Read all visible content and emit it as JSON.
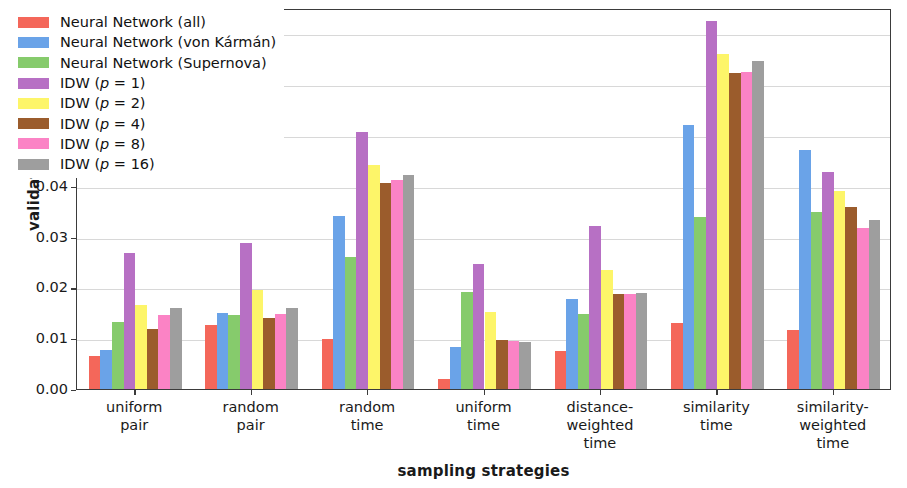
{
  "chart_data": {
    "type": "bar",
    "title": "",
    "xlabel": "sampling strategies",
    "ylabel": "validation cost",
    "ylim": [
      0.0,
      0.075
    ],
    "yticks": [
      "0.00",
      "0.01",
      "0.02",
      "0.03",
      "0.04",
      "0.05",
      "0.06",
      "0.07"
    ],
    "ytick_values": [
      0.0,
      0.01,
      0.02,
      0.03,
      0.04,
      0.05,
      0.06,
      0.07
    ],
    "grid": true,
    "legend_position": "upper left",
    "categories": [
      "uniform\npair",
      "random\npair",
      "random\ntime",
      "uniform\ntime",
      "distance-\nweighted\ntime",
      "similarity\ntime",
      "similarity-\nweighted\ntime"
    ],
    "category_lines": [
      [
        "uniform",
        "pair"
      ],
      [
        "random",
        "pair"
      ],
      [
        "random",
        "time"
      ],
      [
        "uniform",
        "time"
      ],
      [
        "distance-",
        "weighted",
        "time"
      ],
      [
        "similarity",
        "time"
      ],
      [
        "similarity-",
        "weighted",
        "time"
      ]
    ],
    "series": [
      {
        "name": "Neural Network (all)",
        "color": "#f4675a",
        "values": [
          0.0065,
          0.0126,
          0.0098,
          0.002,
          0.0074,
          0.0129,
          0.0117
        ]
      },
      {
        "name": "Neural Network (von Kármán)",
        "color": "#6aa3e8",
        "values": [
          0.0076,
          0.0149,
          0.034,
          0.0082,
          0.0177,
          0.052,
          0.0471
        ]
      },
      {
        "name": "Neural Network (Supernova)",
        "color": "#86cb6c",
        "values": [
          0.0131,
          0.0146,
          0.026,
          0.0191,
          0.0148,
          0.0338,
          0.0348
        ]
      },
      {
        "name": "IDW (p = 1)",
        "color": "#b770c4",
        "values": [
          0.0267,
          0.0287,
          0.0506,
          0.0246,
          0.032,
          0.0724,
          0.0428
        ]
      },
      {
        "name": "IDW (p = 2)",
        "color": "#fdf569",
        "values": [
          0.0166,
          0.0194,
          0.0441,
          0.0152,
          0.0234,
          0.0659,
          0.0389
        ]
      },
      {
        "name": "IDW (p = 4)",
        "color": "#9b5c2c",
        "values": [
          0.0119,
          0.0139,
          0.0406,
          0.0096,
          0.0187,
          0.0622,
          0.0359
        ]
      },
      {
        "name": "IDW (p = 8)",
        "color": "#fb83c5",
        "values": [
          0.0145,
          0.0147,
          0.0411,
          0.0094,
          0.0187,
          0.0624,
          0.0317
        ]
      },
      {
        "name": "IDW (p = 16)",
        "color": "#9e9e9e",
        "values": [
          0.0159,
          0.016,
          0.0422,
          0.0093,
          0.0189,
          0.0646,
          0.0333
        ]
      }
    ]
  },
  "legend": {
    "items": [
      {
        "label_html": "Neural Network (all)",
        "color": "#f4675a"
      },
      {
        "label_html": "Neural Network (von Kármán)",
        "color": "#6aa3e8"
      },
      {
        "label_html": "Neural Network (Supernova)",
        "color": "#86cb6c"
      },
      {
        "label_html": "IDW (<i>p</i> = 1)",
        "color": "#b770c4"
      },
      {
        "label_html": "IDW (<i>p</i> = 2)",
        "color": "#fdf569"
      },
      {
        "label_html": "IDW (<i>p</i> = 4)",
        "color": "#9b5c2c"
      },
      {
        "label_html": "IDW (<i>p</i> = 8)",
        "color": "#fb83c5"
      },
      {
        "label_html": "IDW (<i>p</i> = 16)",
        "color": "#9e9e9e"
      }
    ]
  }
}
